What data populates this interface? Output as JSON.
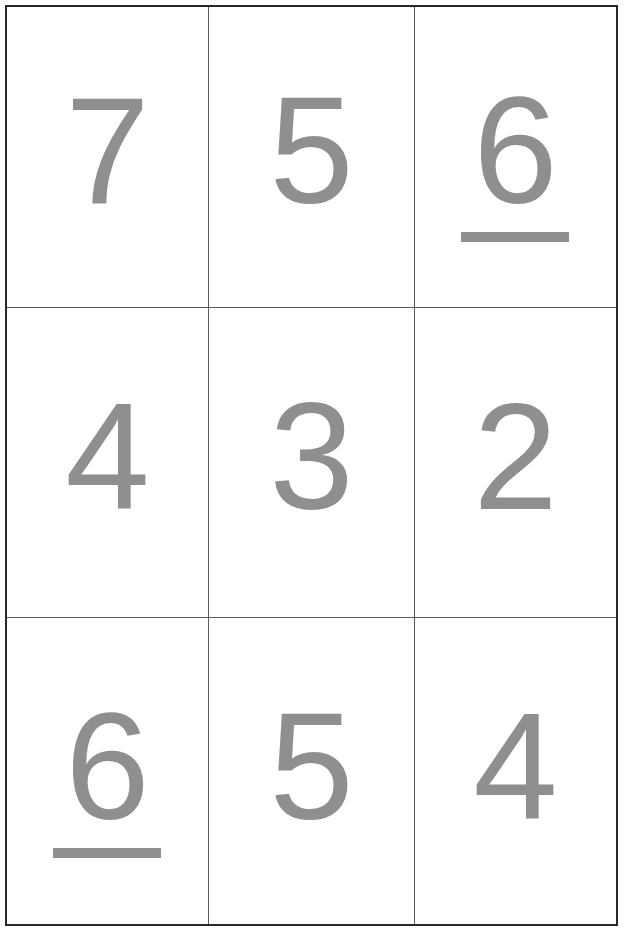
{
  "page": {
    "background_color": "#ffffff",
    "border_color": "#28282c",
    "divider_color": "#5a5a5e",
    "digit_color": "#8f8f8f"
  },
  "grid": {
    "rows": 3,
    "columns": 3,
    "cells": [
      {
        "id": "r0c0",
        "value": "7",
        "underlined": false
      },
      {
        "id": "r0c1",
        "value": "5",
        "underlined": false
      },
      {
        "id": "r0c2",
        "value": "6",
        "underlined": true
      },
      {
        "id": "r1c0",
        "value": "4",
        "underlined": false
      },
      {
        "id": "r1c1",
        "value": "3",
        "underlined": false
      },
      {
        "id": "r1c2",
        "value": "2",
        "underlined": false
      },
      {
        "id": "r2c0",
        "value": "6",
        "underlined": true
      },
      {
        "id": "r2c1",
        "value": "5",
        "underlined": false
      },
      {
        "id": "r2c2",
        "value": "4",
        "underlined": false
      }
    ]
  }
}
